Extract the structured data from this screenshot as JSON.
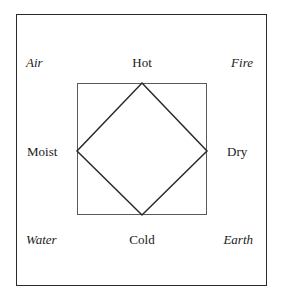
{
  "diagram": {
    "type": "square-of-opposition",
    "colors": {
      "line": "#2a2a2a",
      "inner_line": "#5a5a5a",
      "text": "#1a1a1a",
      "background": "#ffffff"
    },
    "elements": {
      "top_left": "Air",
      "top_right": "Fire",
      "bottom_left": "Water",
      "bottom_right": "Earth"
    },
    "qualities": {
      "top": "Hot",
      "bottom": "Cold",
      "left": "Moist",
      "right": "Dry"
    }
  }
}
